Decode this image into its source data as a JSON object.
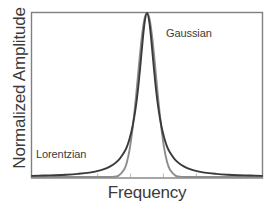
{
  "chart_data": {
    "type": "line",
    "title": "",
    "xlabel": "Frequency",
    "ylabel": "Normalized Amplitude",
    "grid": false,
    "legend_position": "inline-annotations",
    "xlim": [
      -5,
      5
    ],
    "ylim": [
      0,
      1.0
    ],
    "x_tick_labels": [],
    "y_tick_labels": [],
    "x_tick_count": 6,
    "annotations": [
      {
        "text": "Gaussian",
        "x": 1.05,
        "y": 0.88
      },
      {
        "text": "Lorentzian",
        "x": -4.0,
        "y": 0.17
      }
    ],
    "series": [
      {
        "name": "Lorentzian",
        "color": "#3a3a3a",
        "linewidth": 1.9,
        "description": "Heavy-tailed Cauchy lineshape, tails remain above baseline at plot edges",
        "hwhm": 0.42,
        "center": 0.0,
        "peak": 1.0,
        "x": [
          -5.0,
          -4.5,
          -4.0,
          -3.5,
          -3.0,
          -2.5,
          -2.0,
          -1.75,
          -1.5,
          -1.25,
          -1.0,
          -0.875,
          -0.75,
          -0.625,
          -0.5,
          -0.4,
          -0.3,
          -0.2,
          -0.1,
          0.0,
          0.1,
          0.2,
          0.3,
          0.4,
          0.5,
          0.625,
          0.75,
          0.875,
          1.0,
          1.25,
          1.5,
          1.75,
          2.0,
          2.5,
          3.0,
          3.5,
          4.0,
          4.5,
          5.0
        ],
        "y": [
          0.007,
          0.009,
          0.011,
          0.014,
          0.019,
          0.027,
          0.042,
          0.054,
          0.073,
          0.101,
          0.15,
          0.184,
          0.238,
          0.311,
          0.414,
          0.524,
          0.662,
          0.815,
          0.946,
          1.0,
          0.946,
          0.815,
          0.662,
          0.524,
          0.414,
          0.311,
          0.238,
          0.184,
          0.15,
          0.101,
          0.073,
          0.054,
          0.042,
          0.027,
          0.019,
          0.014,
          0.011,
          0.009,
          0.007
        ]
      },
      {
        "name": "Gaussian",
        "color": "#8c8c8c",
        "linewidth": 1.9,
        "description": "Normal lineshape, decays rapidly to baseline well inside the axes",
        "sigma": 0.4,
        "center": 0.0,
        "peak": 1.0,
        "x": [
          -5.0,
          -4.5,
          -4.0,
          -3.5,
          -3.0,
          -2.5,
          -2.0,
          -1.75,
          -1.5,
          -1.25,
          -1.0,
          -0.875,
          -0.75,
          -0.625,
          -0.5,
          -0.4,
          -0.3,
          -0.2,
          -0.1,
          0.0,
          0.1,
          0.2,
          0.3,
          0.4,
          0.5,
          0.625,
          0.75,
          0.875,
          1.0,
          1.25,
          1.5,
          1.75,
          2.0,
          2.5,
          3.0,
          3.5,
          4.0,
          4.5,
          5.0
        ],
        "y": [
          0.0,
          0.0,
          0.0,
          0.0,
          0.0,
          0.0,
          0.0,
          0.0001,
          0.0009,
          0.0072,
          0.0439,
          0.0902,
          0.1726,
          0.2981,
          0.4578,
          0.6065,
          0.7548,
          0.8825,
          0.9692,
          1.0,
          0.9692,
          0.8825,
          0.7548,
          0.6065,
          0.4578,
          0.2981,
          0.1726,
          0.0902,
          0.0439,
          0.0072,
          0.0009,
          0.0001,
          0.0,
          0.0,
          0.0,
          0.0,
          0.0,
          0.0,
          0.0
        ]
      }
    ]
  },
  "axes": {
    "xlabel": "Frequency",
    "ylabel": "Normalized Amplitude",
    "frame_color": "#808080"
  },
  "annotations": {
    "gaussian": "Gaussian",
    "lorentzian": "Lorentzian"
  }
}
